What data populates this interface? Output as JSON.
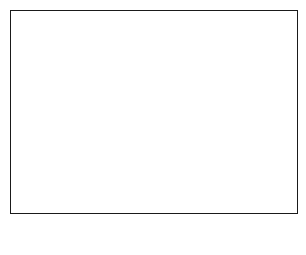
{
  "map": {
    "longitude_labels_top": [
      "94",
      "80"
    ],
    "longitude_labels_bottom": [
      "94",
      "80"
    ],
    "latitude_labels_left": [
      "14"
    ],
    "latitude_labels_right": [
      "14"
    ],
    "region_marker": "1",
    "inset_marker": "2",
    "land_fill": "#bdbdbd",
    "line_color": "#1a1a1a"
  },
  "scale_bar": {
    "min_label": "0",
    "max_label": "400",
    "caption": "scale of miles"
  },
  "corner_marks": {
    "bottom_right": "MZ"
  }
}
